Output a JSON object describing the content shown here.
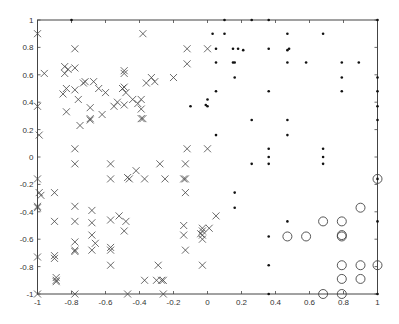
{
  "chart_data": {
    "type": "scatter",
    "title": "",
    "xlabel": "",
    "ylabel": "",
    "xlim": [
      -1,
      1
    ],
    "ylim": [
      -1,
      1
    ],
    "grid": false,
    "legend": null,
    "x_ticks": [
      -1,
      -0.8,
      -0.6,
      -0.4,
      -0.2,
      0,
      0.2,
      0.4,
      0.6,
      0.8,
      1
    ],
    "x_tick_labels": [
      "-1",
      "-0.8",
      "-0.6",
      "-0.4",
      "-0.2",
      "0",
      "0.2",
      "0.4",
      "0.6",
      "0.8",
      "1"
    ],
    "y_ticks": [
      1,
      0.8,
      0.6,
      0.4,
      0.2,
      0,
      -0.2,
      -0.4,
      -0.6,
      -0.8,
      -1
    ],
    "y_tick_labels": [
      "1",
      "0.8",
      "0.6",
      "0.4",
      "0.2",
      "0",
      "-0.2",
      "-0.4",
      "-0.6",
      "-0.8",
      "-1"
    ],
    "series": [
      {
        "name": "class-x",
        "marker": "x",
        "points": [
          [
            -1.0,
            0.9
          ],
          [
            -0.78,
            0.79
          ],
          [
            -0.96,
            0.61
          ],
          [
            -0.84,
            0.66
          ],
          [
            -0.84,
            0.61
          ],
          [
            -0.82,
            0.64
          ],
          [
            -0.78,
            0.65
          ],
          [
            -0.83,
            0.5
          ],
          [
            -0.85,
            0.46
          ],
          [
            -0.78,
            0.49
          ],
          [
            -0.76,
            0.42
          ],
          [
            -0.73,
            0.54
          ],
          [
            -0.72,
            0.55
          ],
          [
            -0.67,
            0.55
          ],
          [
            -0.64,
            0.5
          ],
          [
            -0.6,
            0.47
          ],
          [
            -0.55,
            0.37
          ],
          [
            -0.53,
            0.4
          ],
          [
            -0.5,
            0.5
          ],
          [
            -0.49,
            0.51
          ],
          [
            -0.48,
            0.47
          ],
          [
            -0.44,
            0.42
          ],
          [
            -0.41,
            0.39
          ],
          [
            -0.39,
            0.35
          ],
          [
            -0.39,
            0.28
          ],
          [
            -0.38,
            0.28
          ],
          [
            -0.36,
            0.54
          ],
          [
            -0.33,
            0.58
          ],
          [
            -0.31,
            0.55
          ],
          [
            -0.49,
            0.61
          ],
          [
            -0.49,
            0.63
          ],
          [
            -0.49,
            0.38
          ],
          [
            -0.62,
            0.31
          ],
          [
            -0.69,
            0.36
          ],
          [
            -0.69,
            0.28
          ],
          [
            -0.69,
            0.27
          ],
          [
            -0.75,
            0.23
          ],
          [
            -0.83,
            0.33
          ],
          [
            -1.0,
            0.37
          ],
          [
            -0.99,
            0.16
          ],
          [
            -0.78,
            0.06
          ],
          [
            -0.39,
            0.42
          ],
          [
            -0.2,
            0.58
          ],
          [
            -0.12,
            0.68
          ],
          [
            -0.12,
            0.79
          ],
          [
            -0.38,
            0.9
          ],
          [
            0.0,
            0.79
          ],
          [
            -0.12,
            0.06
          ],
          [
            0.0,
            0.06
          ],
          [
            -0.78,
            -0.05
          ],
          [
            -0.57,
            -0.05
          ],
          [
            -0.28,
            -0.05
          ],
          [
            -0.13,
            -0.05
          ],
          [
            -0.57,
            -0.16
          ],
          [
            -0.47,
            -0.15
          ],
          [
            -0.46,
            -0.16
          ],
          [
            -0.42,
            -0.1
          ],
          [
            -0.37,
            -0.16
          ],
          [
            -0.25,
            -0.16
          ],
          [
            -0.14,
            -0.16
          ],
          [
            -0.13,
            -0.16
          ],
          [
            -0.13,
            -0.26
          ],
          [
            -1.0,
            -0.16
          ],
          [
            -0.99,
            -0.26
          ],
          [
            -0.98,
            -0.28
          ],
          [
            -0.9,
            -0.26
          ],
          [
            -1.0,
            -0.36
          ],
          [
            -1.0,
            -0.37
          ],
          [
            -0.78,
            -0.36
          ],
          [
            -0.68,
            -0.39
          ],
          [
            -0.57,
            -0.46
          ],
          [
            -0.52,
            -0.43
          ],
          [
            -0.48,
            -0.47
          ],
          [
            -0.9,
            -0.47
          ],
          [
            -0.78,
            -0.47
          ],
          [
            -0.68,
            -0.48
          ],
          [
            -0.49,
            -0.54
          ],
          [
            -0.68,
            -0.57
          ],
          [
            -0.66,
            -0.63
          ],
          [
            -0.78,
            -0.62
          ],
          [
            -0.78,
            -0.68
          ],
          [
            -0.78,
            -0.69
          ],
          [
            -0.68,
            -0.68
          ],
          [
            -0.57,
            -0.66
          ],
          [
            -0.57,
            -0.68
          ],
          [
            -0.9,
            -0.72
          ],
          [
            -0.9,
            -0.74
          ],
          [
            -1.0,
            -0.73
          ],
          [
            -0.57,
            -0.79
          ],
          [
            -0.89,
            -0.88
          ],
          [
            -0.89,
            -0.9
          ],
          [
            -0.89,
            -0.91
          ],
          [
            -0.37,
            -0.9
          ],
          [
            -0.3,
            -0.9
          ],
          [
            -0.27,
            -0.9
          ],
          [
            -0.26,
            -0.9
          ],
          [
            -0.29,
            -0.79
          ],
          [
            -1.0,
            -1.0
          ],
          [
            -0.78,
            -1.0
          ],
          [
            -0.47,
            -1.0
          ],
          [
            -0.26,
            -1.0
          ],
          [
            -0.14,
            -0.5
          ],
          [
            -0.14,
            -0.57
          ],
          [
            -0.13,
            -0.68
          ],
          [
            -0.03,
            -0.52
          ],
          [
            -0.03,
            -0.54
          ],
          [
            -0.04,
            -0.56
          ],
          [
            -0.03,
            -0.57
          ],
          [
            -0.03,
            -0.6
          ],
          [
            -0.03,
            -0.79
          ],
          [
            0.01,
            -0.52
          ],
          [
            0.05,
            -0.43
          ]
        ]
      },
      {
        "name": "class-dot",
        "marker": "dot",
        "points": [
          [
            -0.8,
            1.0
          ],
          [
            0.1,
            1.0
          ],
          [
            0.26,
            1.0
          ],
          [
            0.36,
            1.0
          ],
          [
            1.0,
            1.0
          ],
          [
            0.03,
            0.9
          ],
          [
            0.1,
            0.9
          ],
          [
            0.47,
            0.9
          ],
          [
            0.68,
            0.9
          ],
          [
            0.05,
            0.79
          ],
          [
            0.15,
            0.79
          ],
          [
            0.18,
            0.79
          ],
          [
            0.21,
            0.78
          ],
          [
            0.36,
            0.79
          ],
          [
            0.47,
            0.78
          ],
          [
            0.48,
            0.79
          ],
          [
            0.05,
            0.69
          ],
          [
            0.15,
            0.69
          ],
          [
            0.16,
            0.69
          ],
          [
            0.47,
            0.69
          ],
          [
            0.58,
            0.69
          ],
          [
            0.79,
            0.69
          ],
          [
            0.89,
            0.69
          ],
          [
            0.16,
            0.58
          ],
          [
            0.79,
            0.58
          ],
          [
            1.0,
            0.58
          ],
          [
            0.05,
            0.48
          ],
          [
            0.36,
            0.48
          ],
          [
            0.79,
            0.48
          ],
          [
            1.0,
            0.48
          ],
          [
            0.0,
            0.42
          ],
          [
            -0.01,
            0.38
          ],
          [
            0.0,
            0.37
          ],
          [
            -0.1,
            0.37
          ],
          [
            1.0,
            0.37
          ],
          [
            0.26,
            0.27
          ],
          [
            0.47,
            0.27
          ],
          [
            1.0,
            0.27
          ],
          [
            0.05,
            0.16
          ],
          [
            0.47,
            0.16
          ],
          [
            0.36,
            0.06
          ],
          [
            0.68,
            0.06
          ],
          [
            0.36,
            0.0
          ],
          [
            0.68,
            0.0
          ],
          [
            0.26,
            -0.05
          ],
          [
            0.36,
            -0.05
          ],
          [
            0.68,
            -0.05
          ],
          [
            0.16,
            -0.26
          ],
          [
            0.16,
            -0.37
          ],
          [
            0.47,
            -0.47
          ],
          [
            1.0,
            -0.47
          ],
          [
            0.36,
            -0.58
          ],
          [
            0.36,
            -0.79
          ],
          [
            0.36,
            -1.0
          ],
          [
            1.0,
            -1.0
          ],
          [
            1.0,
            -0.16
          ]
        ]
      },
      {
        "name": "class-o",
        "marker": "circle",
        "points": [
          [
            1.0,
            -0.16
          ],
          [
            0.9,
            -0.37
          ],
          [
            0.68,
            -0.47
          ],
          [
            0.79,
            -0.47
          ],
          [
            0.47,
            -0.58
          ],
          [
            0.58,
            -0.58
          ],
          [
            0.79,
            -0.57
          ],
          [
            0.79,
            -0.58
          ],
          [
            0.79,
            -0.79
          ],
          [
            0.9,
            -0.79
          ],
          [
            1.0,
            -0.79
          ],
          [
            0.79,
            -0.89
          ],
          [
            0.9,
            -0.89
          ],
          [
            0.68,
            -1.0
          ],
          [
            0.79,
            -1.0
          ]
        ]
      }
    ]
  }
}
